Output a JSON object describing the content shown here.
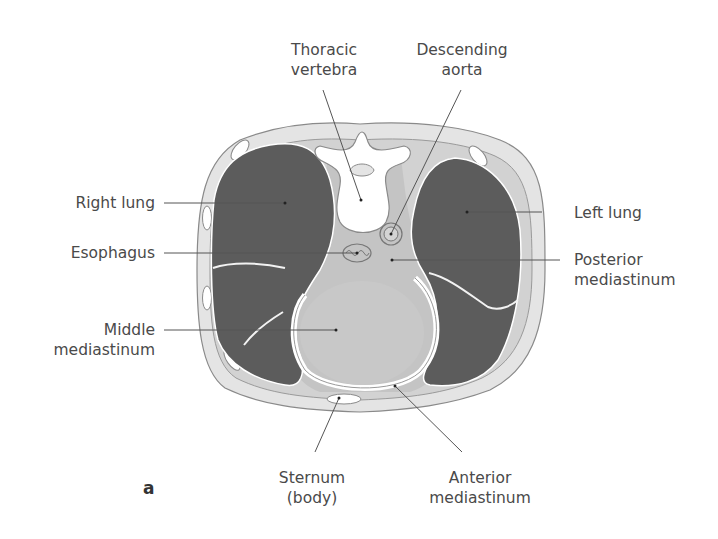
{
  "figure": {
    "panel_letter": "a",
    "colors": {
      "lung": "#5c5c5c",
      "mediastinum": "#c4c4c4",
      "body_wall": "#e4e4e4",
      "outline": "#8a8a8a",
      "bone": "#ffffff",
      "label_text": "#4a4a4a",
      "leader_line": "#555555"
    },
    "labels": {
      "thoracic_vertebra": {
        "line1": "Thoracic",
        "line2": "vertebra"
      },
      "descending_aorta": {
        "line1": "Descending",
        "line2": "aorta"
      },
      "right_lung": "Right lung",
      "left_lung": "Left lung",
      "esophagus": "Esophagus",
      "posterior_mediastinum": {
        "line1": "Posterior",
        "line2": "mediastinum"
      },
      "middle_mediastinum": {
        "line1": "Middle",
        "line2": "mediastinum"
      },
      "sternum": {
        "line1": "Sternum",
        "line2": "(body)"
      },
      "anterior_mediastinum": {
        "line1": "Anterior",
        "line2": "mediastinum"
      }
    }
  }
}
